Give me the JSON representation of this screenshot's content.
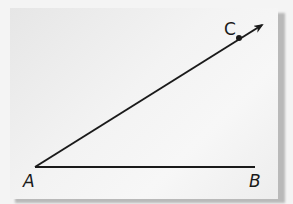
{
  "diagram": {
    "type": "geometry-angle",
    "colors": {
      "background": "#f4f4f4",
      "card": "#f0f0f0",
      "stroke": "#1a1a1a",
      "shadow": "#b9b9b9"
    },
    "points": {
      "A": {
        "label": "A",
        "x": 35,
        "y": 167
      },
      "B": {
        "label": "B",
        "x": 255,
        "y": 167
      },
      "C": {
        "label": "C",
        "x": 239,
        "y": 38
      }
    },
    "segments": [
      {
        "from": "A",
        "to": "B",
        "kind": "segment"
      },
      {
        "from": "A",
        "to": "C",
        "kind": "ray",
        "arrow_tip": {
          "x": 263,
          "y": 24
        }
      }
    ]
  }
}
